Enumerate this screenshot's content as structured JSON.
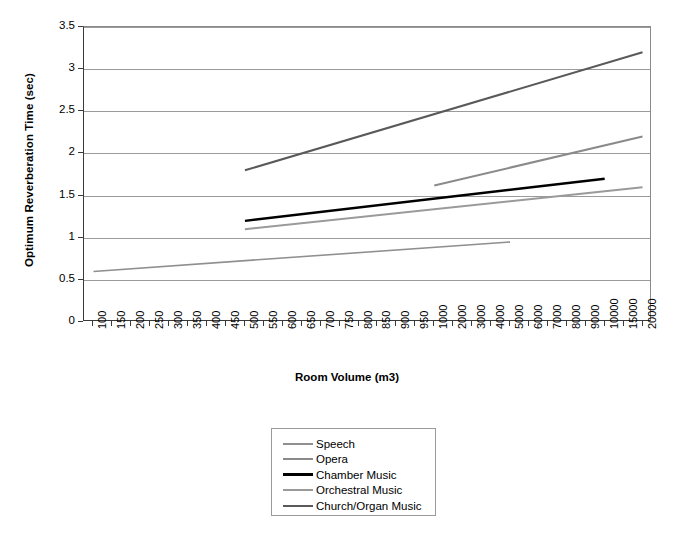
{
  "chart_data": {
    "type": "line",
    "title": "",
    "xlabel": "Room Volume (m3)",
    "ylabel": "Optimum Reverberation Time (sec)",
    "ylim": [
      0,
      3.5
    ],
    "yticks": [
      "0",
      "0.5",
      "1",
      "1.5",
      "2",
      "2.5",
      "3",
      "3.5"
    ],
    "ytick_values": [
      0,
      0.5,
      1,
      1.5,
      2,
      2.5,
      3,
      3.5
    ],
    "grid": "horizontal",
    "legend_position": "below-plot",
    "categories": [
      "100",
      "150",
      "200",
      "250",
      "300",
      "350",
      "400",
      "450",
      "500",
      "550",
      "600",
      "650",
      "700",
      "750",
      "800",
      "850",
      "900",
      "950",
      "1000",
      "2000",
      "3000",
      "4000",
      "5000",
      "6000",
      "7000",
      "8000",
      "9000",
      "10000",
      "15000",
      "20000"
    ],
    "series": [
      {
        "name": "Speech",
        "color": "#8f8f8f",
        "width": 1.6,
        "points": [
          {
            "x": "100",
            "y": 0.6
          },
          {
            "x": "5000",
            "y": 0.95
          }
        ]
      },
      {
        "name": "Opera",
        "color": "#8a8a8a",
        "width": 2.0,
        "points": [
          {
            "x": "1000",
            "y": 1.62
          },
          {
            "x": "20000",
            "y": 2.2
          }
        ]
      },
      {
        "name": "Chamber Music",
        "color": "#000000",
        "width": 2.4,
        "points": [
          {
            "x": "500",
            "y": 1.2
          },
          {
            "x": "10000",
            "y": 1.7
          }
        ]
      },
      {
        "name": "Orchestral Music",
        "color": "#9a9a9a",
        "width": 2.0,
        "points": [
          {
            "x": "500",
            "y": 1.1
          },
          {
            "x": "20000",
            "y": 1.6
          }
        ]
      },
      {
        "name": "Church/Organ Music",
        "color": "#595959",
        "width": 2.0,
        "points": [
          {
            "x": "500",
            "y": 1.8
          },
          {
            "x": "20000",
            "y": 3.2
          }
        ]
      }
    ]
  },
  "legend": {
    "items": [
      {
        "label": "Speech",
        "color": "#8f8f8f",
        "width": 2
      },
      {
        "label": "Opera",
        "color": "#8a8a8a",
        "width": 2.5
      },
      {
        "label": "Chamber Music",
        "color": "#000000",
        "width": 3.2
      },
      {
        "label": "Orchestral Music",
        "color": "#9a9a9a",
        "width": 2.5
      },
      {
        "label": "Church/Organ Music",
        "color": "#595959",
        "width": 2.5
      }
    ]
  }
}
